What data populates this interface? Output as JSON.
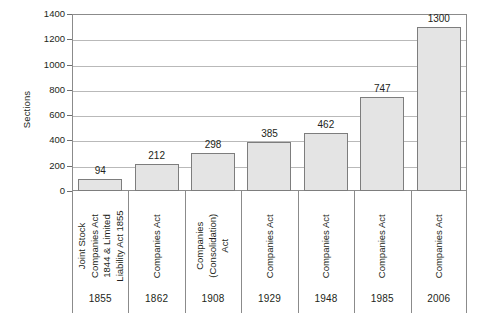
{
  "chart_data": {
    "type": "bar",
    "title": "",
    "xlabel": "",
    "ylabel": "Sections",
    "ylim": [
      0,
      1400
    ],
    "ytick_step": 200,
    "yticks": [
      0,
      200,
      400,
      600,
      800,
      1000,
      1200,
      1400
    ],
    "grid": true,
    "legend": "none",
    "categories": [
      "1855",
      "1862",
      "1908",
      "1929",
      "1948",
      "1985",
      "2006"
    ],
    "category_names": [
      "Joint Stock Companies Act 1844 & Limited Liability Act 1855",
      "Companies Act",
      "Companies (Consolidation) Act",
      "Companies Act",
      "Companies Act",
      "Companies Act",
      "Companies Act"
    ],
    "category_name_lines": [
      [
        "Joint Stock",
        "Companies Act",
        "1844 & Limited",
        "Liability Act 1855"
      ],
      [
        "Companies Act"
      ],
      [
        "Companies",
        "(Consolidation)",
        "Act"
      ],
      [
        "Companies Act"
      ],
      [
        "Companies Act"
      ],
      [
        "Companies Act"
      ],
      [
        "Companies Act"
      ]
    ],
    "values": [
      94,
      212,
      298,
      385,
      462,
      747,
      1300
    ],
    "value_labels": [
      "94",
      "212",
      "298",
      "385",
      "462",
      "747",
      "1300"
    ]
  },
  "style": {
    "bar_fill": "#e4e4e4",
    "bar_border": "#7d7d7d",
    "gridline_color": "#b9b9b9",
    "axis_color": "#8b8b8b",
    "text_color": "#231f20",
    "background": "#ffffff"
  }
}
